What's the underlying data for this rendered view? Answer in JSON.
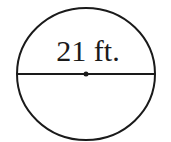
{
  "diagram": {
    "shape": "circle",
    "diameter_label": "21 ft.",
    "colors": {
      "stroke": "#1a1a1a",
      "background": "#ffffff"
    }
  }
}
